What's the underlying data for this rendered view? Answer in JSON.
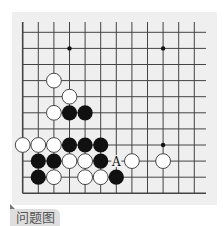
{
  "caption": "问题图",
  "board": {
    "background": "#efefef",
    "line_color": "#444444",
    "columns": 12,
    "rows": 11,
    "open_edges": [
      "top",
      "right"
    ],
    "star_points": [
      [
        3,
        1
      ],
      [
        9,
        1
      ],
      [
        9,
        7
      ]
    ],
    "stones": {
      "white": [
        [
          2,
          3
        ],
        [
          3,
          4
        ],
        [
          2,
          5
        ],
        [
          0,
          7
        ],
        [
          1,
          7
        ],
        [
          2,
          7
        ],
        [
          3,
          8
        ],
        [
          4,
          8
        ],
        [
          7,
          8
        ],
        [
          9,
          8
        ],
        [
          2,
          9
        ],
        [
          4,
          9
        ],
        [
          5,
          9
        ]
      ],
      "black": [
        [
          3,
          5
        ],
        [
          4,
          5
        ],
        [
          3,
          7
        ],
        [
          4,
          7
        ],
        [
          5,
          7
        ],
        [
          1,
          8
        ],
        [
          2,
          8
        ],
        [
          5,
          8
        ],
        [
          1,
          9
        ],
        [
          6,
          9
        ]
      ]
    },
    "labels": [
      {
        "text": "A",
        "col": 6,
        "row": 8
      }
    ]
  }
}
